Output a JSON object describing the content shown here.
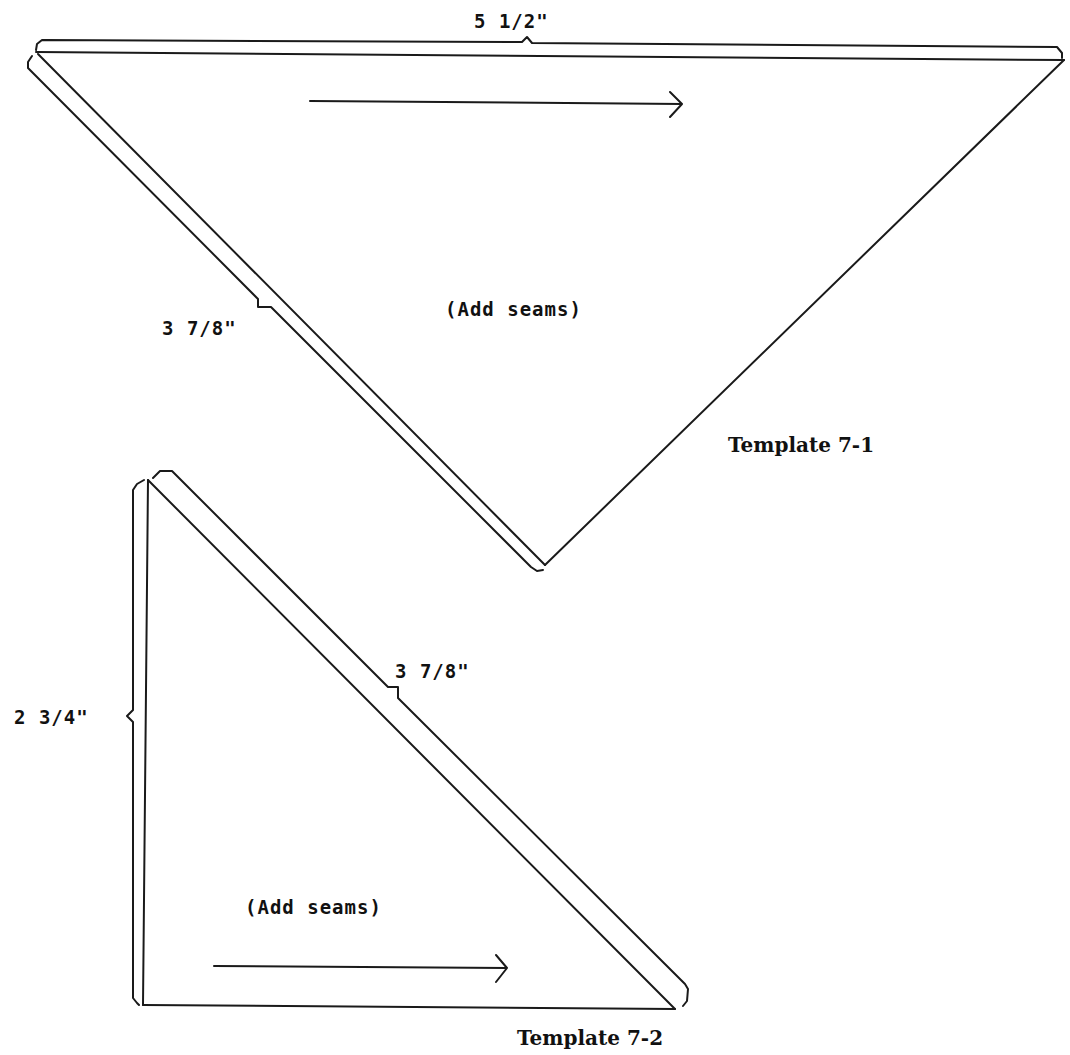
{
  "templates": [
    {
      "id": "7-1",
      "title": "Template 7-1",
      "shape": "triangle",
      "dimensions": {
        "top_edge": "5 1/2\"",
        "left_edge": "3 7/8\""
      },
      "note": "(Add seams)",
      "grain_arrow": "right"
    },
    {
      "id": "7-2",
      "title": "Template 7-2",
      "shape": "right-triangle",
      "dimensions": {
        "hypotenuse": "3 7/8\"",
        "left_edge": "2 3/4\""
      },
      "note": "(Add seams)",
      "grain_arrow": "right"
    }
  ],
  "colors": {
    "line": "#1a1a1a",
    "background": "#ffffff"
  }
}
